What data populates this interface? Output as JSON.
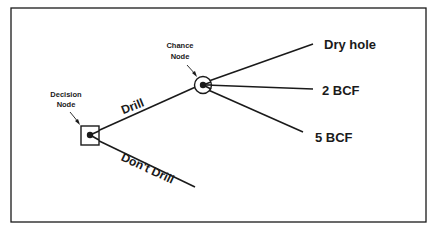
{
  "diagram": {
    "type": "decision-tree",
    "decision_node": {
      "label_line1": "Decision",
      "label_line2": "Node"
    },
    "chance_node": {
      "label_line1": "Chance",
      "label_line2": "Node"
    },
    "decision_branches": [
      {
        "label": "Drill"
      },
      {
        "label": "Don't Drill"
      }
    ],
    "chance_outcomes": [
      {
        "label": "Dry hole"
      },
      {
        "label": "2 BCF"
      },
      {
        "label": "5 BCF"
      }
    ],
    "colors": {
      "ink": "#1a1a1a",
      "background": "#ffffff"
    }
  }
}
